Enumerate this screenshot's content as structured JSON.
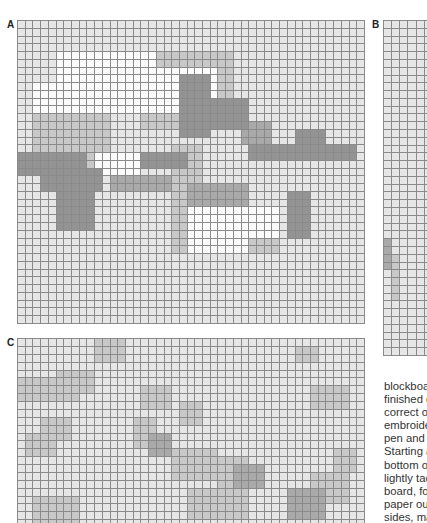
{
  "panels": {
    "A": {
      "label": "A",
      "cols": 45,
      "rows": 39,
      "x": 17,
      "y": 20,
      "w": 348,
      "h": 304
    },
    "B": {
      "label": "B",
      "cols": 6,
      "rows": 43,
      "x": 383,
      "y": 20,
      "w": 50,
      "h": 336
    },
    "C": {
      "label": "C",
      "cols": 45,
      "rows": 24,
      "x": 17,
      "y": 338,
      "w": 348,
      "h": 190
    }
  },
  "shades": {
    "white": "#fbfbfb",
    "base": "#e6e6e6",
    "light": "#c8c8c8",
    "medium": "#a9a9a9",
    "dark": "#939393",
    "gridline": "#8a8a8a"
  },
  "chart_patterns": {
    "A": {
      "white_regions": [
        [
          4,
          5,
          12,
          18
        ],
        [
          6,
          14,
          12,
          26
        ],
        [
          8,
          2,
          12,
          10
        ],
        [
          17,
          10,
          20,
          16
        ],
        [
          22,
          22,
          30,
          30
        ],
        [
          24,
          30,
          28,
          34
        ]
      ],
      "light_regions": [
        [
          4,
          16,
          14,
          28
        ],
        [
          10,
          2,
          20,
          12
        ],
        [
          16,
          20,
          26,
          24
        ],
        [
          26,
          20,
          30,
          34
        ]
      ],
      "dark_regions": [
        [
          7,
          21,
          15,
          25
        ],
        [
          10,
          24,
          14,
          30
        ],
        [
          16,
          30,
          18,
          44
        ],
        [
          17,
          0,
          20,
          9
        ],
        [
          19,
          3,
          22,
          11
        ],
        [
          22,
          5,
          27,
          10
        ],
        [
          17,
          16,
          19,
          22
        ],
        [
          22,
          35,
          28,
          38
        ],
        [
          14,
          36,
          18,
          40
        ]
      ],
      "medium_regions": [
        [
          20,
          12,
          22,
          20
        ],
        [
          21,
          22,
          24,
          30
        ],
        [
          13,
          29,
          16,
          33
        ]
      ]
    },
    "B": {
      "medium_regions": [
        [
          28,
          0,
          32,
          1
        ]
      ],
      "light_regions": [
        [
          30,
          1,
          36,
          2
        ]
      ]
    },
    "C": {
      "light_regions": [
        [
          0,
          10,
          3,
          14
        ],
        [
          4,
          5,
          7,
          10
        ],
        [
          5,
          0,
          8,
          8
        ],
        [
          10,
          3,
          13,
          7
        ],
        [
          12,
          1,
          15,
          5
        ],
        [
          6,
          16,
          9,
          20
        ],
        [
          8,
          21,
          11,
          24
        ],
        [
          14,
          20,
          18,
          26
        ],
        [
          15,
          26,
          20,
          30
        ],
        [
          6,
          38,
          9,
          43
        ],
        [
          1,
          36,
          3,
          39
        ],
        [
          14,
          41,
          17,
          44
        ],
        [
          17,
          38,
          21,
          43
        ],
        [
          19,
          22,
          23,
          30
        ],
        [
          10,
          15,
          14,
          18
        ],
        [
          20,
          2,
          24,
          8
        ]
      ],
      "medium_regions": [
        [
          12,
          17,
          15,
          20
        ],
        [
          16,
          28,
          19,
          32
        ],
        [
          19,
          35,
          23,
          40
        ]
      ]
    }
  },
  "body_text": {
    "lines": [
      "blockboa",
      "finished e",
      "correct ou",
      "embroide",
      "pen and ta",
      "Starting a",
      "bottom of",
      "lightly tacl",
      "board, fol",
      "paper out",
      "sides, ma",
      "...a..fi.."
    ]
  }
}
